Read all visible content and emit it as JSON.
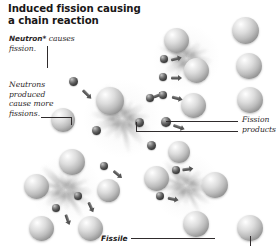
{
  "figure": {
    "title": "Induced fission causing\na chain reaction",
    "title_line1": "Induced fission causing",
    "title_line2": "a chain reaction",
    "background_color": "#ffffff",
    "ink_color": "#231f20",
    "style": "grayscale 3D scientific illustration"
  },
  "labels": {
    "neutron": {
      "term": "Neutron*",
      "rest_line1": " causes",
      "rest_line2": "fission.",
      "full_text": "Neutron* causes fission.",
      "emphasis": "bold-italic-term"
    },
    "neutrons_produced": {
      "line1": "Neutrons",
      "line2": "produced",
      "line3": "cause more",
      "line4": "fissions.",
      "full_text": "Neutrons produced cause more fissions.",
      "emphasis": "italic"
    },
    "fission_products": {
      "line1": "Fission",
      "line2": "products",
      "full_text": "Fission products",
      "emphasis": "italic"
    },
    "fissile": {
      "text": "Fissile",
      "emphasis": "bold-italic"
    }
  },
  "legend_colors": {
    "nucleus_sphere": "#c9c9c9",
    "neutron_sphere": "#3a3a3a",
    "arrow": "#555555",
    "burst_flash": "#9a9a9a",
    "leader_line": "#2f2b2c"
  },
  "chart_data": {
    "type": "diagram",
    "title": "Induced fission causing a chain reaction",
    "elements": {
      "fission_events": 4,
      "incoming_neutrons": 1,
      "nucleus_count": 18,
      "neutron_count": 14,
      "arrow_count": 11
    },
    "annotations": [
      {
        "text": "Neutron* causes fission.",
        "target": "incoming neutron",
        "leader": "vertical"
      },
      {
        "text": "Neutrons produced cause more fissions.",
        "target": "secondary fission nucleus",
        "leader": "horizontal"
      },
      {
        "text": "Fission products",
        "target": "split nuclei fragments",
        "leader": "two horizontal"
      },
      {
        "text": "Fissile",
        "target": "fissile nucleus",
        "leader": "horizontal"
      }
    ]
  },
  "bursts": [
    {
      "id": "burst-primary",
      "x": 122,
      "y": 118,
      "scale": 1.0
    },
    {
      "id": "burst-upper-right",
      "x": 186,
      "y": 58,
      "scale": 0.86
    },
    {
      "id": "burst-lower-right",
      "x": 186,
      "y": 186,
      "scale": 0.88
    },
    {
      "id": "burst-lower-left",
      "x": 66,
      "y": 190,
      "scale": 0.9
    }
  ],
  "nuclei": [
    {
      "id": "n1",
      "x": 110,
      "y": 101,
      "d": 28
    },
    {
      "id": "n2",
      "x": 63,
      "y": 120,
      "d": 24
    },
    {
      "id": "n3",
      "x": 176,
      "y": 40,
      "d": 25
    },
    {
      "id": "n4",
      "x": 196,
      "y": 70,
      "d": 25
    },
    {
      "id": "n5",
      "x": 193,
      "y": 105,
      "d": 25
    },
    {
      "id": "n6",
      "x": 245,
      "y": 30,
      "d": 27
    },
    {
      "id": "n7",
      "x": 249,
      "y": 66,
      "d": 26
    },
    {
      "id": "n8",
      "x": 250,
      "y": 100,
      "d": 26
    },
    {
      "id": "n9",
      "x": 179,
      "y": 152,
      "d": 22
    },
    {
      "id": "n10",
      "x": 156,
      "y": 178,
      "d": 25
    },
    {
      "id": "n11",
      "x": 215,
      "y": 185,
      "d": 26
    },
    {
      "id": "n12",
      "x": 196,
      "y": 224,
      "d": 26
    },
    {
      "id": "n13",
      "x": 250,
      "y": 228,
      "d": 26
    },
    {
      "id": "n14",
      "x": 72,
      "y": 162,
      "d": 26
    },
    {
      "id": "n15",
      "x": 36,
      "y": 186,
      "d": 25
    },
    {
      "id": "n16",
      "x": 108,
      "y": 190,
      "d": 23
    },
    {
      "id": "n17",
      "x": 41,
      "y": 228,
      "d": 25
    },
    {
      "id": "n18",
      "x": 90,
      "y": 228,
      "d": 25
    }
  ],
  "neutrons": [
    {
      "id": "p1",
      "x": 73,
      "y": 81,
      "d": 9
    },
    {
      "id": "p2",
      "x": 96,
      "y": 130,
      "d": 9
    },
    {
      "id": "p3",
      "x": 139,
      "y": 122,
      "d": 9
    },
    {
      "id": "p4",
      "x": 166,
      "y": 122,
      "d": 10
    },
    {
      "id": "p5",
      "x": 150,
      "y": 98,
      "d": 8
    },
    {
      "id": "p6",
      "x": 151,
      "y": 145,
      "d": 9
    },
    {
      "id": "p7",
      "x": 164,
      "y": 59,
      "d": 8
    },
    {
      "id": "p8",
      "x": 163,
      "y": 77,
      "d": 8
    },
    {
      "id": "p9",
      "x": 163,
      "y": 95,
      "d": 8
    },
    {
      "id": "p10",
      "x": 176,
      "y": 170,
      "d": 8
    },
    {
      "id": "p11",
      "x": 160,
      "y": 196,
      "d": 8
    },
    {
      "id": "p12",
      "x": 104,
      "y": 166,
      "d": 8
    },
    {
      "id": "p13",
      "x": 78,
      "y": 196,
      "d": 8
    },
    {
      "id": "p14",
      "x": 56,
      "y": 208,
      "d": 8
    }
  ],
  "arrows": [
    {
      "id": "a1",
      "x": 80,
      "y": 89,
      "len": 13,
      "rot": 45
    },
    {
      "id": "a2",
      "x": 155,
      "y": 97,
      "len": 12,
      "rot": -22
    },
    {
      "id": "a3",
      "x": 172,
      "y": 60,
      "len": 12,
      "rot": -14
    },
    {
      "id": "a4",
      "x": 171,
      "y": 78,
      "len": 12,
      "rot": 0
    },
    {
      "id": "a5",
      "x": 171,
      "y": 97,
      "len": 12,
      "rot": 14
    },
    {
      "id": "a6",
      "x": 172,
      "y": 125,
      "len": 13,
      "rot": 20
    },
    {
      "id": "a7",
      "x": 183,
      "y": 170,
      "len": 12,
      "rot": -8
    },
    {
      "id": "a8",
      "x": 167,
      "y": 198,
      "len": 12,
      "rot": 12
    },
    {
      "id": "a9",
      "x": 111,
      "y": 170,
      "len": 12,
      "rot": 40
    },
    {
      "id": "a10",
      "x": 85,
      "y": 200,
      "len": 12,
      "rot": 65
    },
    {
      "id": "a11",
      "x": 62,
      "y": 212,
      "len": 12,
      "rot": 70
    }
  ]
}
